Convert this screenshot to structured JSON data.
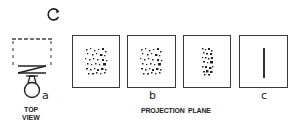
{
  "figure": {
    "top_view": {
      "label_line1": "TOP",
      "label_line2": "VIEW",
      "marker": "a",
      "icon": "rotation-arrow-icon"
    },
    "projection": {
      "label": "PROJECTION  PLANE",
      "marker_b": "b",
      "marker_c": "c",
      "panels": [
        {
          "name": "projection-panel-1",
          "content": "scattered-dots"
        },
        {
          "name": "projection-panel-2",
          "content": "scattered-dots"
        },
        {
          "name": "projection-panel-3",
          "content": "compressed-dots"
        },
        {
          "name": "projection-panel-4",
          "content": "vertical-line"
        }
      ]
    }
  }
}
